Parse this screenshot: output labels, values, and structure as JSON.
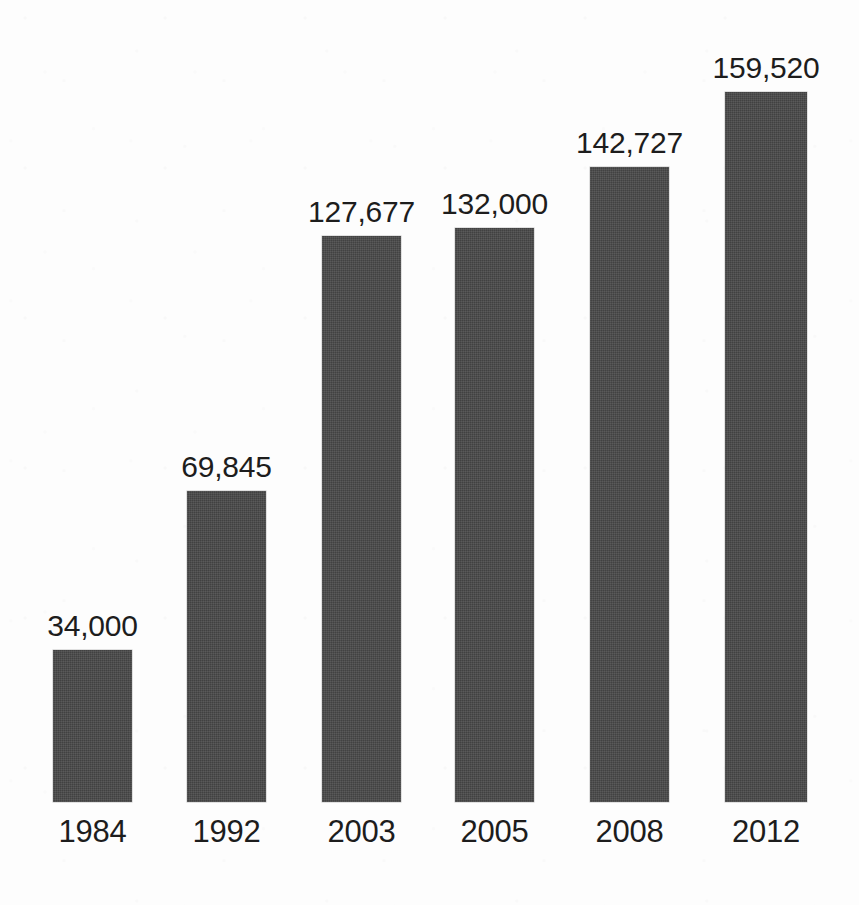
{
  "chart_data": {
    "type": "bar",
    "title": "",
    "subtitle": "",
    "xlabel": "",
    "ylabel": "",
    "categories": [
      "1984",
      "1992",
      "2003",
      "2005",
      "2008",
      "2012"
    ],
    "values": [
      34000,
      69845,
      127677,
      132000,
      142727,
      159520
    ],
    "value_labels": [
      "34,000",
      "69,845",
      "127,677",
      "132,000",
      "142,727",
      "159,520"
    ],
    "ylim": [
      0,
      180000
    ],
    "grid": false,
    "legend": null,
    "legend_position": "none",
    "orientation": "vertical",
    "annotations": [],
    "bars": [
      {
        "category": "1984",
        "value": 34000,
        "label": "34,000",
        "x": 53,
        "width": 79,
        "top": 650,
        "height": 152
      },
      {
        "category": "1992",
        "value": 69845,
        "label": "69,845",
        "x": 187,
        "width": 79,
        "top": 491,
        "height": 311
      },
      {
        "category": "2003",
        "value": 127677,
        "label": "127,677",
        "x": 322,
        "width": 79,
        "top": 236,
        "height": 566
      },
      {
        "category": "2005",
        "value": 132000,
        "label": "132,000",
        "x": 455,
        "width": 79,
        "top": 228,
        "height": 574
      },
      {
        "category": "2008",
        "value": 142727,
        "label": "142,727",
        "x": 590,
        "width": 79,
        "top": 167,
        "height": 635
      },
      {
        "category": "2012",
        "value": 159520,
        "label": "159,520",
        "x": 725,
        "width": 82,
        "top": 92,
        "height": 710
      }
    ]
  },
  "style": {
    "bar_color": "#474747",
    "background_color": "#fdfdfd",
    "text_color": "#1d1d1d",
    "baseline_y": 802
  }
}
